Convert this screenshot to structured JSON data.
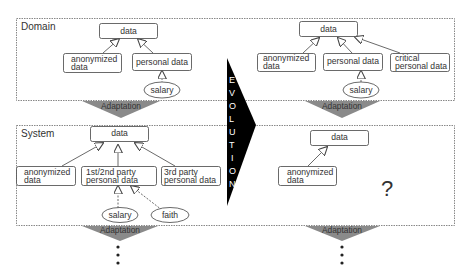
{
  "panels": {
    "domain": {
      "label": "Domain"
    },
    "system": {
      "label": "System"
    }
  },
  "evolution": {
    "letters": [
      "E",
      "V",
      "O",
      "L",
      "U",
      "T",
      "I",
      "O",
      "N"
    ]
  },
  "adaptation": {
    "label": "Adaptation"
  },
  "domain_before": {
    "root": "data",
    "anonymized": [
      "anonymized",
      "data"
    ],
    "personal": "personal data",
    "salary": "salary"
  },
  "domain_after": {
    "root": "data",
    "anonymized": [
      "anonymized",
      "data"
    ],
    "personal": "personal data",
    "critical": [
      "critical",
      "personal data"
    ],
    "salary": "salary"
  },
  "system_before": {
    "root": "data",
    "anonymized": [
      "anonymized",
      "data"
    ],
    "first_second": [
      "1st/2nd party",
      "personal data"
    ],
    "third": [
      "3rd party",
      "personal data"
    ],
    "salary": "salary",
    "faith": "faith"
  },
  "system_after": {
    "root": "data",
    "anonymized": [
      "anonymized",
      "data"
    ],
    "unknown": "?"
  },
  "continuation": {
    "dots": "⋮"
  }
}
